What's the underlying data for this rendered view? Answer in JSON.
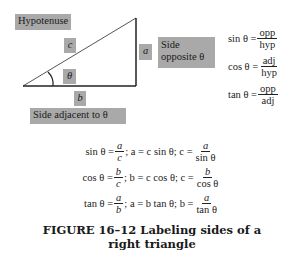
{
  "figure": {
    "labels": {
      "hypotenuse": "Hypotenuse",
      "c": "c",
      "theta": "θ",
      "a": "a",
      "side_opposite_line1": "Side",
      "side_opposite_line2": "opposite θ",
      "b": "b",
      "side_adjacent": "Side adjacent to θ"
    },
    "right_formulas": [
      {
        "lhs": "sin θ =",
        "num": "opp",
        "den": "hyp"
      },
      {
        "lhs": "cos θ =",
        "num": "adj",
        "den": "hyp"
      },
      {
        "lhs": "tan θ =",
        "num": "opp",
        "den": "adj"
      }
    ],
    "bottom_formulas": [
      {
        "lhs": "sin θ =",
        "num1": "a",
        "den1": "c",
        "mid": "; a = c sin θ; c =",
        "num2": "a",
        "den2": "sin θ"
      },
      {
        "lhs": "cos θ =",
        "num1": "b",
        "den1": "c",
        "mid": "; b = c cos θ; c =",
        "num2": "b",
        "den2": "cos θ"
      },
      {
        "lhs": "tan θ =",
        "num1": "a",
        "den1": "b",
        "mid": "; a = b tan θ; b =",
        "num2": "a",
        "den2": "tan θ"
      }
    ],
    "caption_line1": "FIGURE 16–12   Labeling sides of a",
    "caption_line2": "right triangle",
    "colors": {
      "label_box": "#a9a9a9",
      "line": "#222222"
    }
  }
}
